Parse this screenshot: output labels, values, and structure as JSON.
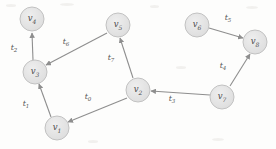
{
  "figure": {
    "kind": "directed-graph-diagram",
    "width": 276,
    "height": 149,
    "background_color": "#fdfdfc",
    "node_fill_color": "#e3e3e3",
    "node_stroke_color": "#b9b9b9",
    "edge_color": "#8e8e8e",
    "label_color": "#4a4a4a"
  },
  "nodes": [
    {
      "id": "v4",
      "label": "v",
      "sub": "4",
      "cx": 32,
      "cy": 19,
      "r": 12
    },
    {
      "id": "v3",
      "label": "v",
      "sub": "3",
      "cx": 35,
      "cy": 72,
      "r": 12
    },
    {
      "id": "v1",
      "label": "v",
      "sub": "1",
      "cx": 57,
      "cy": 128,
      "r": 12
    },
    {
      "id": "v5",
      "label": "v",
      "sub": "5",
      "cx": 118,
      "cy": 25,
      "r": 12
    },
    {
      "id": "v2",
      "label": "v",
      "sub": "2",
      "cx": 138,
      "cy": 90,
      "r": 12
    },
    {
      "id": "v6",
      "label": "v",
      "sub": "6",
      "cx": 197,
      "cy": 25,
      "r": 12
    },
    {
      "id": "v8",
      "label": "v",
      "sub": "8",
      "cx": 255,
      "cy": 42,
      "r": 12
    },
    {
      "id": "v7",
      "label": "v",
      "sub": "7",
      "cx": 222,
      "cy": 97,
      "r": 12
    }
  ],
  "edges": [
    {
      "id": "t2",
      "label": "t",
      "sub": "2",
      "from": "v3",
      "to": "v4",
      "lx": 14,
      "ly": 48
    },
    {
      "id": "t6",
      "label": "t",
      "sub": "6",
      "from": "v5",
      "to": "v3",
      "lx": 66,
      "ly": 42
    },
    {
      "id": "t1",
      "label": "t",
      "sub": "1",
      "from": "v1",
      "to": "v3",
      "lx": 26,
      "ly": 104
    },
    {
      "id": "t0",
      "label": "t",
      "sub": "0",
      "from": "v2",
      "to": "v1",
      "lx": 88,
      "ly": 97
    },
    {
      "id": "t7",
      "label": "t",
      "sub": "7",
      "from": "v2",
      "to": "v5",
      "lx": 111,
      "ly": 58
    },
    {
      "id": "t3",
      "label": "t",
      "sub": "3",
      "from": "v7",
      "to": "v2",
      "lx": 172,
      "ly": 99
    },
    {
      "id": "t5",
      "label": "t",
      "sub": "5",
      "from": "v6",
      "to": "v8",
      "lx": 228,
      "ly": 18
    },
    {
      "id": "t4",
      "label": "t",
      "sub": "4",
      "from": "v7",
      "to": "v8",
      "lx": 223,
      "ly": 66
    }
  ]
}
